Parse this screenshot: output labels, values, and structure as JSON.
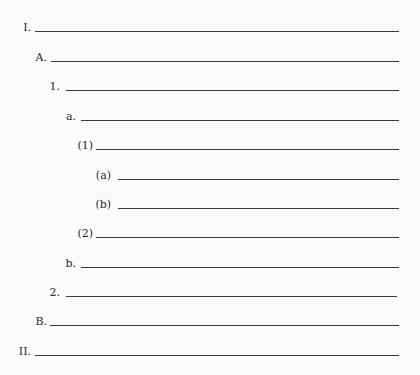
{
  "outline": {
    "items": [
      {
        "label": "I.",
        "level": 1,
        "label_right": 31,
        "line_left": 35,
        "line_right": 399,
        "y": 31
      },
      {
        "label": "A.",
        "level": 2,
        "label_right": 47,
        "line_left": 51,
        "line_right": 399,
        "y": 61
      },
      {
        "label": "1.",
        "level": 3,
        "label_right": 60,
        "line_left": 66,
        "line_right": 399,
        "y": 90
      },
      {
        "label": "a.",
        "level": 4,
        "label_right": 76,
        "line_left": 81,
        "line_right": 399,
        "y": 120
      },
      {
        "label": "(1)",
        "level": 5,
        "label_right": 93,
        "line_left": 96,
        "line_right": 399,
        "y": 149
      },
      {
        "label": "(a)",
        "level": 6,
        "label_right": 111,
        "line_left": 118,
        "line_right": 399,
        "y": 179
      },
      {
        "label": "(b)",
        "level": 6,
        "label_right": 111,
        "line_left": 118,
        "line_right": 399,
        "y": 208
      },
      {
        "label": "(2)",
        "level": 5,
        "label_right": 93,
        "line_left": 96,
        "line_right": 399,
        "y": 237
      },
      {
        "label": "b.",
        "level": 4,
        "label_right": 76,
        "line_left": 81,
        "line_right": 399,
        "y": 267
      },
      {
        "label": "2.",
        "level": 3,
        "label_right": 60,
        "line_left": 66,
        "line_right": 397,
        "y": 296
      },
      {
        "label": "B.",
        "level": 2,
        "label_right": 47,
        "line_left": 50,
        "line_right": 399,
        "y": 325
      },
      {
        "label": "II.",
        "level": 1,
        "label_right": 31,
        "line_left": 35,
        "line_right": 399,
        "y": 355
      }
    ]
  }
}
